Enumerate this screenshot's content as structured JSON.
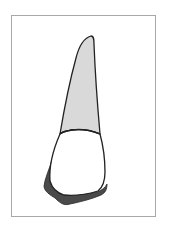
{
  "figure": {
    "parts": [
      {
        "name": "root",
        "fill": "#d9d9d9"
      },
      {
        "name": "crown",
        "fill": "#ffffff"
      },
      {
        "name": "crown-shadow",
        "fill": "#4a4a4a"
      }
    ],
    "colors": {
      "frame": "#a8a8a8",
      "outline": "#222222",
      "root": "#d9d9d9",
      "crown": "#ffffff",
      "shadow": "#4a4a4a"
    }
  }
}
